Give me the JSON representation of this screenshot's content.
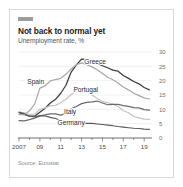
{
  "card": {
    "title": "Not back to normal yet",
    "subtitle": "Unemployment rate, %",
    "source": "Source: Eurostat",
    "mark_color": "#9c9c9c",
    "border_color": "#d9d9d9",
    "background": "#ffffff"
  },
  "chart_data": {
    "type": "line",
    "title": "Not back to normal yet",
    "subtitle": "Unemployment rate, %",
    "xlabel": "",
    "ylabel": "Unemployment rate, %",
    "ylim": [
      0,
      30
    ],
    "yticks": [
      0,
      5,
      10,
      15,
      20,
      25,
      30
    ],
    "ytick_labels": [
      "0",
      "5",
      "10",
      "15",
      "20",
      "25",
      "30"
    ],
    "y_axis_position": "right",
    "xlim": [
      2007,
      2019.75
    ],
    "xticks": [
      2007,
      2009,
      2011,
      2013,
      2015,
      2017,
      2019
    ],
    "xtick_labels": [
      "2007",
      "09",
      "11",
      "13",
      "15",
      "17",
      "19"
    ],
    "grid": true,
    "legend": "inline-labels",
    "x": [
      2007.0,
      2007.5,
      2008.0,
      2008.5,
      2009.0,
      2009.5,
      2010.0,
      2010.5,
      2011.0,
      2011.5,
      2012.0,
      2012.5,
      2013.0,
      2013.5,
      2014.0,
      2014.5,
      2015.0,
      2015.5,
      2016.0,
      2016.5,
      2017.0,
      2017.5,
      2018.0,
      2018.5,
      2019.0,
      2019.5
    ],
    "series": [
      {
        "name": "Greece",
        "color": "#3c3c3c",
        "width": 1.25,
        "label_x": 2014.3,
        "label_y": 25.8,
        "values": [
          8.8,
          8.2,
          7.6,
          7.6,
          9.0,
          10.4,
          12.2,
          13.5,
          15.6,
          18.4,
          23.0,
          25.5,
          27.5,
          27.3,
          26.6,
          26.0,
          25.2,
          24.5,
          23.7,
          23.3,
          21.8,
          20.8,
          19.7,
          18.9,
          17.6,
          16.8
        ]
      },
      {
        "name": "Spain",
        "color": "#a8a8a8",
        "width": 1.25,
        "label_x": 2008.6,
        "label_y": 18.7,
        "values": [
          8.2,
          8.1,
          9.5,
          11.8,
          17.4,
          18.2,
          19.9,
          20.4,
          20.8,
          22.2,
          24.1,
          25.6,
          26.2,
          25.6,
          24.8,
          23.8,
          22.5,
          21.2,
          20.3,
          19.2,
          17.8,
          16.8,
          15.6,
          14.8,
          14.0,
          13.6
        ]
      },
      {
        "name": "Portugal",
        "color": "#c4c4c4",
        "width": 1.25,
        "label_x": 2013.4,
        "label_y": 16.2,
        "values": [
          9.1,
          8.8,
          8.2,
          8.3,
          10.0,
          10.5,
          11.2,
          11.4,
          12.3,
          13.5,
          15.2,
          16.5,
          17.4,
          16.6,
          15.0,
          13.8,
          12.8,
          12.3,
          11.8,
          11.0,
          9.5,
          8.8,
          7.5,
          7.0,
          6.6,
          6.5
        ]
      },
      {
        "name": "Italy",
        "color": "#6b6b6b",
        "width": 1.25,
        "label_x": 2011.9,
        "label_y": 8.2,
        "values": [
          6.1,
          6.0,
          6.4,
          6.9,
          7.7,
          8.1,
          8.4,
          8.4,
          8.0,
          8.6,
          10.2,
          11.0,
          12.0,
          12.4,
          12.6,
          12.9,
          12.2,
          11.6,
          11.7,
          11.7,
          11.3,
          11.0,
          10.6,
          10.5,
          9.9,
          9.7
        ]
      },
      {
        "name": "Germany",
        "color": "#585858",
        "width": 1.1,
        "label_x": 2012.0,
        "label_y": 4.4,
        "values": [
          9.0,
          8.5,
          7.6,
          7.3,
          7.8,
          7.7,
          7.2,
          6.8,
          6.1,
          5.7,
          5.5,
          5.4,
          5.3,
          5.1,
          5.1,
          4.9,
          4.7,
          4.5,
          4.3,
          4.0,
          3.8,
          3.6,
          3.4,
          3.3,
          3.1,
          3.0
        ]
      }
    ]
  }
}
